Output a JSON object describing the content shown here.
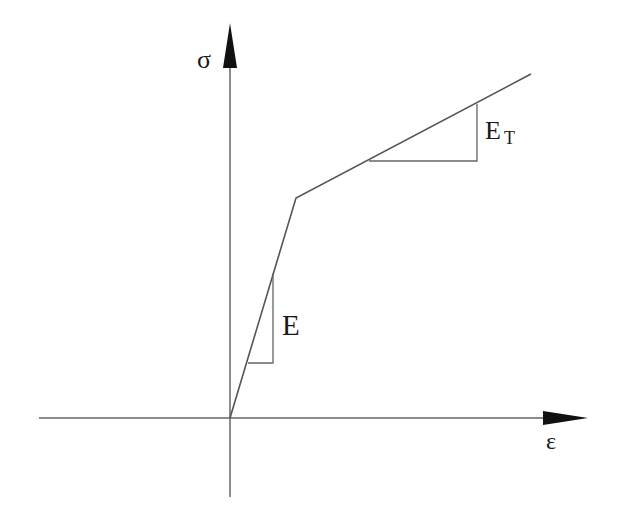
{
  "diagram": {
    "type": "bilinear-stress-strain",
    "colors": {
      "line": "#666666",
      "arrow": "#111111",
      "text": "#1a1a1a",
      "background": "#ffffff"
    },
    "axes": {
      "x_label": "ε",
      "y_label": "σ",
      "origin": [
        230,
        418
      ],
      "x_axis": {
        "from": [
          39,
          418
        ],
        "to": [
          588,
          418
        ]
      },
      "y_axis": {
        "from": [
          230,
          497
        ],
        "to": [
          230,
          23
        ]
      }
    },
    "curve": {
      "points": [
        [
          230,
          418
        ],
        [
          296,
          198
        ],
        [
          531,
          74
        ]
      ],
      "segments": [
        "elastic",
        "plastic-hardening"
      ]
    },
    "slope_triangles": [
      {
        "label": "E",
        "description": "elastic modulus",
        "points": [
          [
            248,
            363
          ],
          [
            273,
            363
          ],
          [
            273,
            273
          ]
        ]
      },
      {
        "label": "E",
        "subscript": "T",
        "description": "tangent modulus",
        "points": [
          [
            369,
            161
          ],
          [
            477,
            161
          ],
          [
            477,
            104
          ]
        ]
      }
    ]
  },
  "labels": {
    "sigma": "σ",
    "epsilon": "ε",
    "elastic_modulus": "E",
    "tangent_modulus_main": "E",
    "tangent_modulus_sub": "T"
  }
}
